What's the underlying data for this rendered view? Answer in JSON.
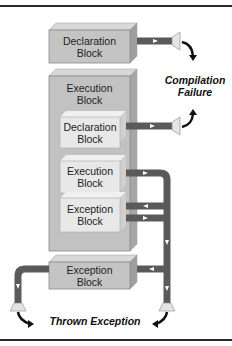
{
  "diagram": {
    "blocks": {
      "top_declaration": "Declaration\nBlock",
      "outer_execution": "Execution\nBlock",
      "inner_declaration": "Declaration\nBlock",
      "inner_execution": "Execution\nBlock",
      "inner_exception": "Exception\nBlock",
      "outer_exception": "Exception\nBlock"
    },
    "labels": {
      "compilation_failure_line1": "Compilation",
      "compilation_failure_line2": "Failure",
      "thrown_exception": "Thrown Exception"
    },
    "colors": {
      "block_fill": "#c8c8c8",
      "inner_block_fill": "#e6e6e6",
      "pipe": "#5a5a5a",
      "border_rule": "#2a2a2a"
    }
  }
}
